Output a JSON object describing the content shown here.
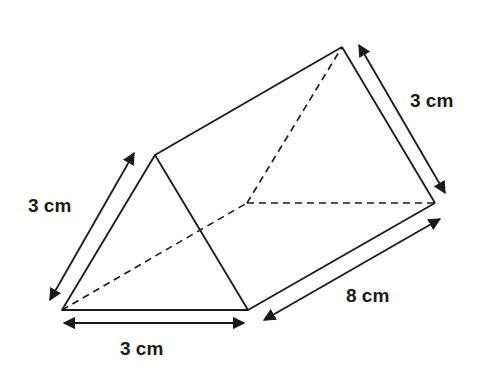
{
  "figure": {
    "type": "triangular-prism",
    "stroke_color": "#1a1a1a",
    "background": "#ffffff"
  },
  "labels": {
    "left_edge": "3 cm",
    "bottom_edge": "3 cm",
    "right_top_edge": "3 cm",
    "length_edge": "8 cm"
  }
}
